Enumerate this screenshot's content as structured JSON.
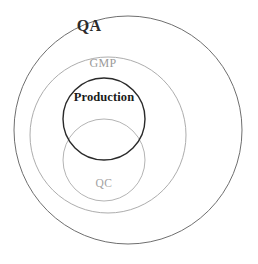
{
  "diagram": {
    "type": "nested-circles-venn",
    "title": "",
    "background_color": "#ffffff",
    "canvas": {
      "width": 258,
      "height": 264
    },
    "circles": [
      {
        "id": "qa",
        "label": "QA",
        "label_color": "#2b2b2b",
        "label_weight": "bold",
        "stroke_color": "#6f6f6f",
        "stroke_width": 1,
        "fill": "none",
        "cx": 128,
        "cy": 130,
        "r": 114,
        "level": 1
      },
      {
        "id": "gmp",
        "label": "GMP",
        "label_color": "#9a9a9a",
        "label_weight": "normal",
        "stroke_color": "#adadad",
        "stroke_width": 1,
        "fill": "none",
        "cx": 108,
        "cy": 135,
        "r": 78,
        "level": 2
      },
      {
        "id": "production",
        "label": "Production",
        "label_color": "#1a1a1a",
        "label_weight": "bold",
        "stroke_color": "#2a2a2a",
        "stroke_width": 1.4,
        "fill": "none",
        "cx": 104,
        "cy": 119,
        "r": 41,
        "level": 3
      },
      {
        "id": "qc",
        "label": "QC",
        "label_color": "#a3a3a3",
        "label_weight": "normal",
        "stroke_color": "#b4b4b4",
        "stroke_width": 1,
        "fill": "none",
        "cx": 104,
        "cy": 160,
        "r": 41,
        "level": 3
      }
    ],
    "relations": [
      "GMP is inside QA",
      "Production is inside GMP",
      "QC is inside GMP",
      "Production and QC overlap"
    ]
  }
}
